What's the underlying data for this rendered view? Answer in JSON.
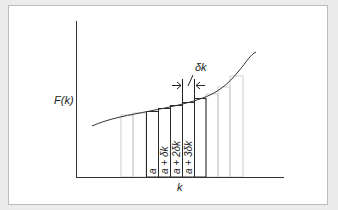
{
  "diagram": {
    "y_axis_label": "F(k)",
    "x_axis_label": "k",
    "interval_label": "δk",
    "bar_labels": [
      "a",
      "a + δk",
      "a + 2δk",
      "a + 3δk"
    ],
    "colors": {
      "background": "#ececec",
      "frame": "#ffffff",
      "axis": "#222222",
      "highlight_bar": "#222222",
      "faint_bar": "#c8c8c8"
    }
  }
}
